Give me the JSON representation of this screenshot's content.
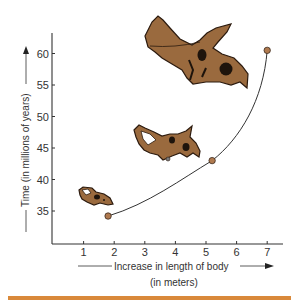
{
  "chart_data": {
    "type": "line",
    "title": "",
    "xlabel": "Increase in length of body",
    "xlabel_sub": "(in meters)",
    "ylabel": "Time (in millions of years)",
    "x_ticks": [
      1,
      2,
      3,
      4,
      5,
      6,
      7
    ],
    "y_ticks": [
      35,
      40,
      45,
      50,
      55,
      60
    ],
    "xlim": [
      -0.05,
      7.5
    ],
    "ylim": [
      29.6,
      64
    ],
    "grid": false,
    "legend": null,
    "series": [
      {
        "name": "Ceratopsian evolution",
        "x": [
          1.8,
          5.2,
          7.0
        ],
        "y": [
          34.2,
          43.0,
          60.5
        ],
        "marker": "circle",
        "curve": "smooth"
      }
    ],
    "annotations": [
      {
        "type": "illustration",
        "label": "small ceratopsian skull",
        "near": [
          1.5,
          37.5
        ]
      },
      {
        "type": "illustration",
        "label": "medium ceratopsian skull",
        "near": [
          4.0,
          46.5
        ]
      },
      {
        "type": "illustration",
        "label": "large triceratops skull",
        "near": [
          4.8,
          58.5
        ]
      }
    ],
    "colors": {
      "skull_fill": "#9a6a3e",
      "skull_outline": "#2b1a0e",
      "point_fill": "#b07a4f",
      "line": "#333333",
      "accent_bar": "#d9893a"
    }
  }
}
